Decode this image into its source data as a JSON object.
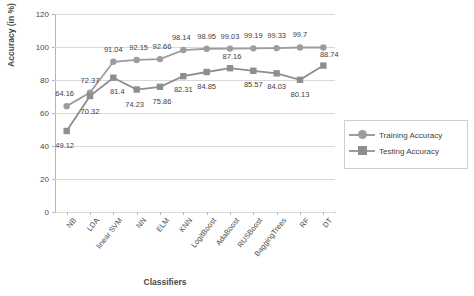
{
  "chart_data": {
    "type": "line",
    "title": "",
    "xlabel": "Classifiers",
    "ylabel": "Accuracy (in %)",
    "ylim": [
      0,
      120
    ],
    "yticks": [
      0,
      20,
      40,
      60,
      80,
      100,
      120
    ],
    "grid": true,
    "legend_position": "right",
    "categories": [
      "NB",
      "LDA",
      "linear SVM",
      "NN",
      "ELM",
      "KNN",
      "LogitBoost",
      "AdaBoost",
      "RUSBoost",
      "BaggingTrees",
      "RF",
      "DT"
    ],
    "series": [
      {
        "name": "Training Accuracy",
        "marker": "circle",
        "color": "#9d9d9d",
        "values": [
          64.16,
          72.37,
          91.04,
          92.15,
          92.66,
          98.14,
          98.95,
          99.03,
          99.19,
          99.33,
          99.7,
          99.7
        ],
        "labels": [
          "64.16",
          "72.37",
          "91.04",
          "92.15",
          "92.66",
          "98.14",
          "98.95",
          "99.03",
          "99.19",
          "99.33",
          "99.7",
          ""
        ]
      },
      {
        "name": "Testing Accuracy",
        "marker": "square",
        "color": "#8e8e8e",
        "values": [
          49.12,
          70.32,
          81.4,
          74.23,
          75.86,
          82.31,
          84.85,
          87.16,
          85.57,
          84.03,
          80.13,
          88.74
        ],
        "labels": [
          "49.12",
          "70.32",
          "81.4",
          "74.23",
          "75.86",
          "82.31",
          "84.85",
          "87.16",
          "85.57",
          "84.03",
          "80.13",
          "88.74"
        ]
      }
    ],
    "legend": [
      {
        "label": "Training Accuracy",
        "marker": "circle"
      },
      {
        "label": "Testing Accuracy",
        "marker": "square"
      }
    ]
  }
}
